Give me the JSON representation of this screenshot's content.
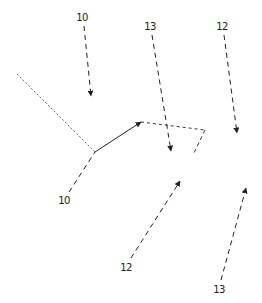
{
  "diagram": {
    "colors": {
      "stroke": "#222222",
      "background": "#ffffff"
    },
    "labels": [
      {
        "id": "label-top-left",
        "text": "10",
        "x": 82,
        "y": 18
      },
      {
        "id": "label-top-middle",
        "text": "13",
        "x": 150,
        "y": 27
      },
      {
        "id": "label-top-right",
        "text": "12",
        "x": 222,
        "y": 27
      },
      {
        "id": "label-bottom-left",
        "text": "10",
        "x": 64,
        "y": 201
      },
      {
        "id": "label-bottom-middle",
        "text": "12",
        "x": 126,
        "y": 268
      },
      {
        "id": "label-bottom-right",
        "text": "13",
        "x": 219,
        "y": 290
      }
    ]
  }
}
